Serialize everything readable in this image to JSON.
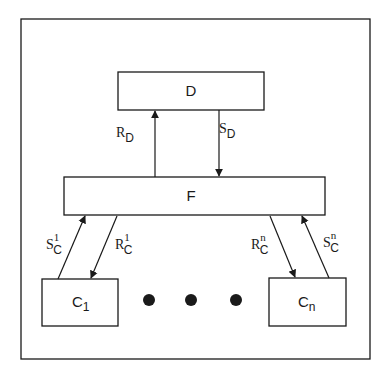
{
  "diagram": {
    "type": "block-diagram",
    "colors": {
      "stroke": "#1a1a1a",
      "background": "#ffffff"
    },
    "nodes": {
      "D": {
        "label": "D"
      },
      "F": {
        "label": "F"
      },
      "C1": {
        "base": "C",
        "sub": "1"
      },
      "Cn": {
        "base": "C",
        "sub": "n"
      }
    },
    "edges": {
      "RD": {
        "base": "R",
        "sub": "D",
        "sup": "",
        "from": "F",
        "to": "D"
      },
      "SD": {
        "base": "S",
        "sub": "D",
        "sup": "",
        "from": "D",
        "to": "F"
      },
      "SC1": {
        "base": "S",
        "sub": "C",
        "sup": "1",
        "from": "C1",
        "to": "F"
      },
      "RC1": {
        "base": "R",
        "sub": "C",
        "sup": "1",
        "from": "F",
        "to": "C1"
      },
      "RCn": {
        "base": "R",
        "sub": "C",
        "sup": "n",
        "from": "F",
        "to": "Cn"
      },
      "SCn": {
        "base": "S",
        "sub": "C",
        "sup": "n",
        "from": "Cn",
        "to": "F"
      }
    },
    "ellipsis": {
      "count": 3,
      "meaning": "more C nodes between C1 and Cn"
    }
  }
}
